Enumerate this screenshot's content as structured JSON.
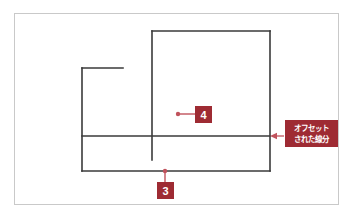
{
  "diagram": {
    "colors": {
      "frame_border": "#c9c9c9",
      "geometry_line": "#3a3a3a",
      "annotation": "#9e2b33",
      "background": "#ffffff",
      "badge_text": "#ffffff"
    },
    "geometry": {
      "left_shape": {
        "name": "left-open-corner",
        "vertical_x": 82,
        "vertical_y_top": 68,
        "vertical_y_bottom": 171,
        "horizontal_y": 68,
        "horizontal_x_start": 82,
        "horizontal_x_end": 123
      },
      "right_rect": {
        "name": "right-rectangle",
        "x_left": 152,
        "x_right": 270,
        "y_top": 31,
        "y_bottom": 136
      },
      "middle_vertical": {
        "name": "middle-vertical-line",
        "x": 152,
        "y_top": 31,
        "y_bottom": 160
      },
      "offset_line": {
        "name": "offset-horizontal-line",
        "y": 136,
        "x_start": 82,
        "x_end": 270
      },
      "bottom_line": {
        "name": "bottom-horizontal-line",
        "y": 171,
        "x_start": 82,
        "x_end": 270
      },
      "right_vertical": {
        "name": "right-vertical-line",
        "x": 270,
        "y_top": 31,
        "y_bottom": 171
      }
    },
    "callouts": [
      {
        "id": "callout-4",
        "label": "4",
        "dot_x": 178,
        "dot_y": 114,
        "leader_to_x": 195,
        "leader_to_y": 114
      },
      {
        "id": "callout-3",
        "label": "3",
        "dot_x": 165,
        "dot_y": 171,
        "leader_to_x": 165,
        "leader_to_y": 182
      }
    ],
    "annotation_label": {
      "id": "offset-label",
      "line1": "オフセット",
      "line2": "された線分",
      "arrow_from_x": 283,
      "arrow_to_x": 271,
      "arrow_y": 136
    }
  }
}
